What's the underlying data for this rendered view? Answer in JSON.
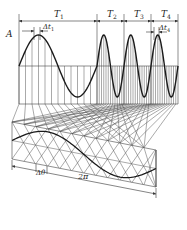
{
  "diagram": {
    "type": "waveform-projection",
    "amplitude_label": "A",
    "period_labels": [
      {
        "main": "T",
        "sub": "1"
      },
      {
        "main": "T",
        "sub": "2"
      },
      {
        "main": "T",
        "sub": "3"
      },
      {
        "main": "T",
        "sub": "4"
      }
    ],
    "interval_labels": [
      {
        "main": "Δt",
        "sub": "1"
      },
      {
        "main": "Δt",
        "sub": "4"
      }
    ],
    "angle_label": "Δθ",
    "full_cycle_label": "2π",
    "colors": {
      "line": "#333333",
      "curve": "#1a1a1a",
      "background": "#ffffff"
    }
  }
}
